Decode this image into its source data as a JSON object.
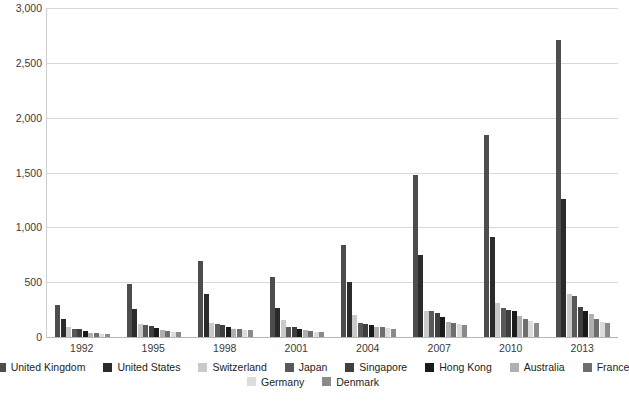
{
  "chart_data": {
    "type": "bar",
    "title": "",
    "xlabel": "",
    "ylabel": "",
    "ylim": [
      0,
      3000
    ],
    "yticks": [
      0,
      500,
      1000,
      1500,
      2000,
      2500,
      3000
    ],
    "ytick_labels": [
      "0",
      "500",
      "1,000",
      "1,500",
      "2,000",
      "2,500",
      "3,000"
    ],
    "grid": true,
    "legend_position": "bottom",
    "categories": [
      "1992",
      "1995",
      "1998",
      "2001",
      "2004",
      "2007",
      "2010",
      "2013"
    ],
    "series": [
      {
        "name": "United Kingdom",
        "color": "#4d4d4d",
        "values": [
          290,
          480,
          690,
          545,
          840,
          1480,
          1845,
          2710
        ]
      },
      {
        "name": "United States",
        "color": "#2b2b2b",
        "values": [
          160,
          260,
          390,
          265,
          505,
          745,
          910,
          1260
        ]
      },
      {
        "name": "Switzerland",
        "color": "#c9c9c9",
        "values": [
          95,
          120,
          130,
          155,
          205,
          240,
          310,
          390
        ]
      },
      {
        "name": "Japan",
        "color": "#595959",
        "values": [
          75,
          110,
          120,
          95,
          130,
          235,
          265,
          375
        ]
      },
      {
        "name": "Singapore",
        "color": "#3f3f3f",
        "values": [
          70,
          100,
          110,
          90,
          120,
          215,
          250,
          270
        ]
      },
      {
        "name": "Hong Kong",
        "color": "#1a1a1a",
        "values": [
          55,
          80,
          95,
          75,
          110,
          185,
          240,
          235
        ]
      },
      {
        "name": "Australia",
        "color": "#b0b0b0",
        "values": [
          40,
          60,
          75,
          60,
          95,
          140,
          190,
          210
        ]
      },
      {
        "name": "France",
        "color": "#6e6e6e",
        "values": [
          35,
          55,
          70,
          55,
          90,
          130,
          160,
          160
        ]
      },
      {
        "name": "Germany",
        "color": "#dcdcdc",
        "values": [
          30,
          50,
          65,
          50,
          80,
          120,
          145,
          140
        ]
      },
      {
        "name": "Denmark",
        "color": "#8a8a8a",
        "values": [
          25,
          45,
          60,
          45,
          70,
          110,
          130,
          130
        ]
      }
    ]
  }
}
